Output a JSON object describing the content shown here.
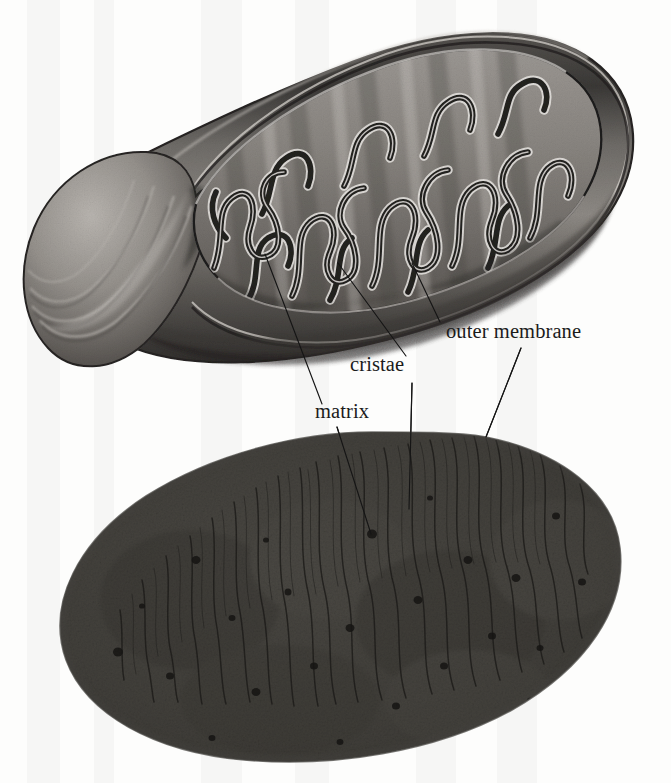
{
  "figure": {
    "background_color": "#fdfdfc",
    "labels": [
      {
        "id": "outer-membrane",
        "text": "outer membrane",
        "x": 446,
        "y": 338,
        "leader_up": "M 440 322 L 412 263",
        "leader_down": "M 521 348 L 486 437"
      },
      {
        "id": "cristae",
        "text": "cristae",
        "x": 350,
        "y": 371,
        "leader_up": "M 406 356 L 338 263",
        "leader_down": "M 412 383 L 409 509"
      },
      {
        "id": "matrix",
        "text": "matrix",
        "x": 315,
        "y": 418,
        "leader_up": "M 322 404 L 265 254",
        "leader_down": "M 337 427 L 371 534"
      }
    ],
    "diagram": {
      "id": "mitochondrion-diagram",
      "description": "Grayscale airbrush-style cutaway drawing of an elongated mitochondrion tilted about 28 degrees, rounded cap at lower left, cut-open interior showing winding cristae",
      "tilt_degrees": -28,
      "colors": {
        "outer_membrane": "#3c3a39",
        "inner_membrane": "#6e6b69",
        "matrix": "#8d8a87",
        "cristae_dark": "#2e2c2b",
        "cristae_highlight": "#e2dfdb",
        "cap_light": "#b8b4b0",
        "cap_dark": "#4a4846"
      }
    },
    "micrograph": {
      "id": "mitochondrion-micrograph",
      "description": "Transmission electron micrograph of a mitochondrion, grainy halftone texture, oblong outline tilted about 16 degrees, dark cristae lines running across the short axis, scattered dark matrix granules",
      "tilt_degrees": -16,
      "colors": {
        "base": "#8f8d88",
        "grain_dark": "#4c4a47",
        "cristae": "#3a3836",
        "granule": "#2b2a28"
      }
    }
  }
}
